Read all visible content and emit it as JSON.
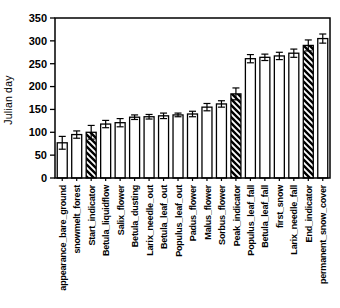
{
  "figure": {
    "background": "#ffffff",
    "ink_color": "#000000"
  },
  "chart_data": {
    "type": "bar",
    "title": "",
    "xlabel": "",
    "ylabel": "Julian day",
    "ylim": [
      0,
      350
    ],
    "ytick_interval": 50,
    "grid": false,
    "legend": "none",
    "bar_fill": "#ffffff",
    "bar_stroke": "#000000",
    "hatch_color": "#000000",
    "error_bars": true,
    "categories": [
      "appearance_bare_ground",
      "snowmelt_forest",
      "Start_indicator",
      "Betula_liquidflow",
      "Salix_flower",
      "Betula_dusting",
      "Larix_needle_out",
      "Betula_leaf_out",
      "Populus_leaf_out",
      "Padus_flower",
      "Malus_flower",
      "Sorbus_flower",
      "Peak_indicator",
      "Populus_leaf_fall",
      "Betula_leaf_fall",
      "first_snow",
      "Larix_needle_fall",
      "End_indicator",
      "permanent_snow_cover"
    ],
    "values": [
      77,
      95,
      100,
      118,
      121,
      133,
      134,
      136,
      138,
      140,
      155,
      162,
      184,
      261,
      264,
      267,
      273,
      290,
      305
    ],
    "errors": [
      14,
      8,
      15,
      8,
      9,
      5,
      5,
      6,
      4,
      6,
      8,
      7,
      13,
      9,
      7,
      8,
      9,
      12,
      10
    ],
    "hatched_categories": [
      "Start_indicator",
      "Peak_indicator",
      "End_indicator"
    ]
  }
}
